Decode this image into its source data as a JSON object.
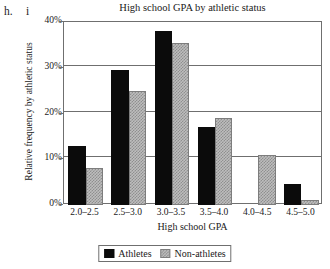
{
  "part_labels": {
    "outer": "h.",
    "inner": "i"
  },
  "chart_data": {
    "type": "bar",
    "title": "High school GPA by athletic status",
    "xlabel": "High school GPA",
    "ylabel": "Relative frequency by athletic status",
    "categories": [
      "2.0–2.5",
      "2.5–3.0",
      "3.0–3.5",
      "3.5–4.0",
      "4.0–4.5",
      "4.5–5.0"
    ],
    "series": [
      {
        "name": "Athletes",
        "color": "#0b0b0b",
        "values": [
          13,
          29.5,
          38,
          17,
          0,
          4.5
        ]
      },
      {
        "name": "Non-athletes",
        "color": "#bdbdbd",
        "values": [
          8,
          25,
          35.5,
          19,
          11,
          1
        ]
      }
    ],
    "ylim": [
      0,
      40
    ],
    "yticks": [
      0,
      10,
      20,
      30,
      40
    ],
    "ytick_labels": [
      "0%",
      "10%",
      "20%",
      "30%",
      "40%"
    ],
    "grid": true,
    "legend_position": "bottom-center"
  }
}
